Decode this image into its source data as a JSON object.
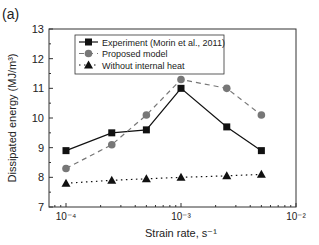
{
  "panel_label": "(a)",
  "chart_data": {
    "type": "line",
    "title": "",
    "xlabel": "Strain rate, s⁻¹",
    "ylabel": "Dissipated energy (MJ/m³)",
    "xscale": "log",
    "xlim": [
      0.0001,
      0.01
    ],
    "ylim": [
      7,
      13
    ],
    "x_ticks": [
      "10⁻⁴",
      "10⁻³",
      "10⁻²"
    ],
    "y_ticks": [
      7,
      8,
      9,
      10,
      11,
      12,
      13
    ],
    "grid": false,
    "legend_position": "upper left",
    "x": [
      0.0001,
      0.00025,
      0.0005,
      0.001,
      0.0025,
      0.005
    ],
    "series": [
      {
        "name": "Experiment (Morin et al., 2011)",
        "marker": "square",
        "line": "solid",
        "color": "#111111",
        "values": [
          8.9,
          9.5,
          9.6,
          11.0,
          9.7,
          8.9
        ]
      },
      {
        "name": "Proposed model",
        "marker": "circle",
        "line": "dashed",
        "color": "#777777",
        "values": [
          8.3,
          9.1,
          10.1,
          11.3,
          11.0,
          10.1
        ]
      },
      {
        "name": "Without internal heat",
        "marker": "triangle",
        "line": "dotted",
        "color": "#111111",
        "values": [
          7.8,
          7.9,
          7.95,
          8.0,
          8.05,
          8.1
        ]
      }
    ]
  }
}
